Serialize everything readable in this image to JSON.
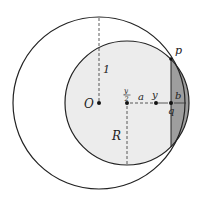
{
  "diagram": {
    "labels": {
      "O": "O",
      "one": "1",
      "R": "R",
      "y_half_num": "y",
      "y_half_den": "2",
      "a": "a",
      "y": "y",
      "b": "b",
      "p": "p",
      "q": "q"
    },
    "colors": {
      "stroke": "#222222",
      "small_fill": "#ececec",
      "lens_fill": "#9e9e9e",
      "background": "#ffffff"
    }
  }
}
